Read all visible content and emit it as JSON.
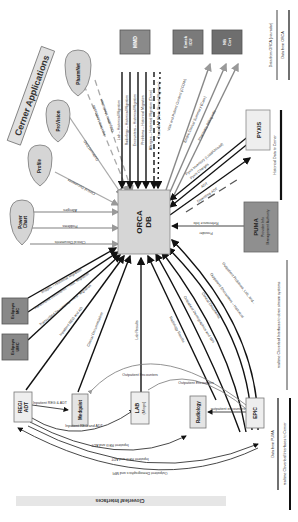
{
  "diagram": {
    "title": "Cerner Applications",
    "footer_title": "Cloverleaf Interfaces",
    "center_node": {
      "label_line1": "ORCA",
      "label_line2": "DB"
    },
    "cerner_apps": [
      {
        "id": "powerchart",
        "label_line1": "Power",
        "label_line2": "Chart"
      },
      {
        "id": "profile",
        "label_line1": "Profile",
        "label_line2": ""
      },
      {
        "id": "profvision",
        "label_line1": "ProVision",
        "label_line2": ""
      },
      {
        "id": "pharmnet",
        "label_line1": "PharmNet",
        "label_line2": ""
      }
    ],
    "top_boxes": [
      {
        "id": "mmd",
        "label": "MMD"
      },
      {
        "id": "emtek",
        "label_line1": "Emtek",
        "label_line2": "ICU"
      },
      {
        "id": "nb",
        "label_line1": "NB",
        "label_line2": "Cert"
      }
    ],
    "right_boxes": [
      {
        "id": "pyxis",
        "label": "PYXIS"
      },
      {
        "id": "puma",
        "label_line1": "PUMA",
        "label_line2": "Provider Info",
        "label_line3": "Management Authority"
      }
    ],
    "left_boxes": [
      {
        "id": "eclipsys_mc",
        "label_line1": "Eclipsys",
        "label_line2": "MC"
      },
      {
        "id": "eclipsys_umc",
        "label_line1": "Eclipsys",
        "label_line2": "UMC"
      }
    ],
    "bottom_boxes": [
      {
        "id": "reg_adt",
        "label_line1": "REG/",
        "label_line2": "ADT"
      },
      {
        "id": "medquist",
        "label": "Medquist"
      },
      {
        "id": "lab",
        "label_line1": "LAB",
        "label_line2": "(Misys)"
      },
      {
        "id": "radiology",
        "label": "Radiology"
      },
      {
        "id": "epic",
        "label": "EPIC"
      }
    ],
    "edge_labels": {
      "powerchart": [
        "Allergies",
        "Problems",
        "Clinical Documents"
      ],
      "profile": [
        "Clinical Documents"
      ],
      "profvision": [
        "Outbound DAD"
      ],
      "pharmnet": [
        "Inpatient Medication",
        "Outpatient Medication"
      ],
      "mmd": [
        "Lab – Historical Migration",
        "Radiology – Historical Migration",
        "Encounters – Historical Migration",
        "Problems – Historical Migration",
        "Allergies – Historical Migration (Done)",
        "Trans DAP (Data Clinical Migration)"
      ],
      "emtek": [
        "Vital and Patient Content (CCOW)",
        "Emtek Clinical Summary (Care)"
      ],
      "nb": [
        "Pharmacy Billing Info"
      ],
      "pyxis": [
        "Pyxis Inventory (Load/Unload)",
        "Pyxis Charges",
        "ADT",
        "Downtime ADT"
      ],
      "puma": [
        "Referrance Info",
        "Provider"
      ],
      "eclipsys": [
        "Images – Historical Migration",
        "Transcribed Documents – Hist. Migration",
        "Transcribed Documents – Hist. Migration",
        "Inpatient REG and AD"
      ],
      "clinical_doc": "Clinical Documentation",
      "lab_results": "Lab Results",
      "radiology_result": "Radiology Results",
      "epic": [
        "Outpatient Demographics and MPI",
        "Clinical Documents",
        "Outpatient Encounters – Historical",
        "Outpatient Problems, Lab, and..."
      ],
      "reg_medquist": "Inpatient REG & ADT",
      "reg_lab": "Inpatient REG and ADT",
      "reg_radiology": "Inpatient REG and ADT",
      "reg_epic1": "Inpatient REG and ADT",
      "reg_epic2": "Outpatient Demographics and MPI",
      "epic_radiology": "outpatient encounters",
      "outpatient_enc1": "Outpatient Encounters",
      "outpatient_enc2": "Outpatient Encounters"
    },
    "legend": [
      {
        "label": "Data from ORCA (via radar)",
        "style": "solid-thin"
      },
      {
        "label": "Data from ORCA",
        "style": "solid"
      },
      {
        "label": "Historical Data to Cerner",
        "style": "thick"
      },
      {
        "label": "realtime Cloverleaf Interfaces to down stream systems",
        "style": "thin"
      },
      {
        "label": "Data from PUMA",
        "style": "solid"
      },
      {
        "label": "realtime Cloverleaf Interfaces to Cerner",
        "style": "thick"
      }
    ],
    "colors": {
      "box_fill": "#d9d9d9",
      "dark_box_fill": "#7a7a7a",
      "line_dark": "#111111",
      "line_gray": "#999999",
      "footer_band": "#e6e6e6"
    }
  }
}
